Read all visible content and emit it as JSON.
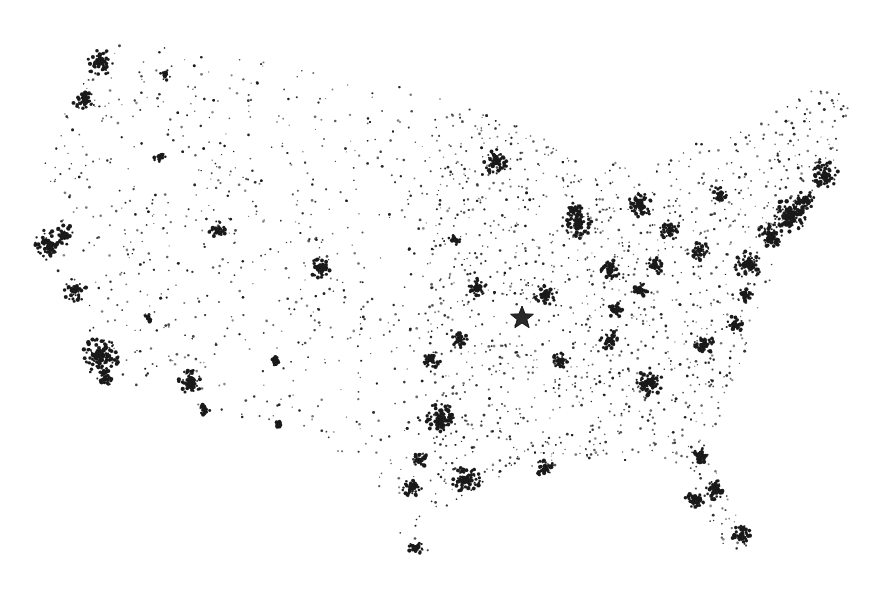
{
  "map": {
    "type": "dot-density population map",
    "region": "contiguous United States",
    "dot_color": "#1a1a1a",
    "background": "#ffffff",
    "outline": [
      [
        100,
        38
      ],
      [
        180,
        45
      ],
      [
        300,
        70
      ],
      [
        420,
        90
      ],
      [
        500,
        120
      ],
      [
        560,
        140
      ],
      [
        590,
        175
      ],
      [
        610,
        160
      ],
      [
        640,
        170
      ],
      [
        700,
        140
      ],
      [
        760,
        120
      ],
      [
        830,
        80
      ],
      [
        850,
        110
      ],
      [
        830,
        175
      ],
      [
        780,
        230
      ],
      [
        770,
        280
      ],
      [
        760,
        320
      ],
      [
        745,
        360
      ],
      [
        720,
        420
      ],
      [
        705,
        440
      ],
      [
        730,
        500
      ],
      [
        748,
        545
      ],
      [
        735,
        560
      ],
      [
        705,
        520
      ],
      [
        690,
        470
      ],
      [
        660,
        460
      ],
      [
        600,
        462
      ],
      [
        540,
        470
      ],
      [
        470,
        490
      ],
      [
        430,
        520
      ],
      [
        430,
        555
      ],
      [
        400,
        545
      ],
      [
        395,
        500
      ],
      [
        360,
        470
      ],
      [
        320,
        440
      ],
      [
        290,
        420
      ],
      [
        250,
        420
      ],
      [
        215,
        410
      ],
      [
        175,
        400
      ],
      [
        125,
        385
      ],
      [
        100,
        360
      ],
      [
        80,
        320
      ],
      [
        55,
        280
      ],
      [
        40,
        220
      ],
      [
        45,
        150
      ],
      [
        70,
        90
      ]
    ],
    "center_marker": {
      "icon": "star-icon",
      "x": 522,
      "y": 318,
      "r": 12
    },
    "clusters": [
      {
        "name": "Seattle",
        "x": 100,
        "y": 62,
        "r": 14,
        "n": 90
      },
      {
        "name": "Portland",
        "x": 85,
        "y": 100,
        "r": 12,
        "n": 70
      },
      {
        "name": "Spokane",
        "x": 165,
        "y": 75,
        "r": 6,
        "n": 25
      },
      {
        "name": "Boise",
        "x": 160,
        "y": 158,
        "r": 6,
        "n": 20
      },
      {
        "name": "San Francisco Bay",
        "x": 50,
        "y": 245,
        "r": 16,
        "n": 110
      },
      {
        "name": "Sacramento",
        "x": 65,
        "y": 235,
        "r": 10,
        "n": 50
      },
      {
        "name": "Central Valley",
        "x": 75,
        "y": 290,
        "r": 12,
        "n": 55
      },
      {
        "name": "Los Angeles",
        "x": 100,
        "y": 355,
        "r": 20,
        "n": 180
      },
      {
        "name": "San Diego",
        "x": 105,
        "y": 378,
        "r": 8,
        "n": 40
      },
      {
        "name": "Las Vegas",
        "x": 148,
        "y": 318,
        "r": 5,
        "n": 25
      },
      {
        "name": "Phoenix",
        "x": 190,
        "y": 382,
        "r": 12,
        "n": 80
      },
      {
        "name": "Tucson",
        "x": 205,
        "y": 410,
        "r": 6,
        "n": 30
      },
      {
        "name": "Salt Lake City",
        "x": 218,
        "y": 230,
        "r": 9,
        "n": 50
      },
      {
        "name": "Denver",
        "x": 320,
        "y": 268,
        "r": 10,
        "n": 60
      },
      {
        "name": "Albuquerque",
        "x": 275,
        "y": 360,
        "r": 6,
        "n": 25
      },
      {
        "name": "El Paso",
        "x": 278,
        "y": 425,
        "r": 5,
        "n": 20
      },
      {
        "name": "Minneapolis",
        "x": 495,
        "y": 162,
        "r": 13,
        "n": 80
      },
      {
        "name": "Milwaukee",
        "x": 575,
        "y": 210,
        "r": 8,
        "n": 45
      },
      {
        "name": "Chicago",
        "x": 578,
        "y": 225,
        "r": 14,
        "n": 110
      },
      {
        "name": "Detroit",
        "x": 640,
        "y": 205,
        "r": 12,
        "n": 90
      },
      {
        "name": "Cleveland",
        "x": 670,
        "y": 230,
        "r": 10,
        "n": 60
      },
      {
        "name": "Pittsburgh",
        "x": 700,
        "y": 250,
        "r": 10,
        "n": 60
      },
      {
        "name": "Indianapolis",
        "x": 610,
        "y": 270,
        "r": 10,
        "n": 55
      },
      {
        "name": "Columbus",
        "x": 655,
        "y": 265,
        "r": 9,
        "n": 50
      },
      {
        "name": "Cincinnati",
        "x": 640,
        "y": 290,
        "r": 8,
        "n": 45
      },
      {
        "name": "St Louis",
        "x": 545,
        "y": 295,
        "r": 11,
        "n": 65
      },
      {
        "name": "Kansas City",
        "x": 478,
        "y": 288,
        "r": 10,
        "n": 55
      },
      {
        "name": "Omaha",
        "x": 455,
        "y": 240,
        "r": 7,
        "n": 30
      },
      {
        "name": "Louisville",
        "x": 615,
        "y": 310,
        "r": 8,
        "n": 40
      },
      {
        "name": "Nashville",
        "x": 610,
        "y": 340,
        "r": 10,
        "n": 55
      },
      {
        "name": "Memphis",
        "x": 560,
        "y": 360,
        "r": 8,
        "n": 40
      },
      {
        "name": "Atlanta",
        "x": 650,
        "y": 382,
        "r": 14,
        "n": 100
      },
      {
        "name": "Charlotte",
        "x": 705,
        "y": 345,
        "r": 10,
        "n": 60
      },
      {
        "name": "Raleigh",
        "x": 735,
        "y": 325,
        "r": 9,
        "n": 50
      },
      {
        "name": "Richmond",
        "x": 745,
        "y": 295,
        "r": 8,
        "n": 45
      },
      {
        "name": "Washington DC",
        "x": 748,
        "y": 265,
        "r": 14,
        "n": 110
      },
      {
        "name": "Philadelphia",
        "x": 770,
        "y": 235,
        "r": 13,
        "n": 110
      },
      {
        "name": "New York",
        "x": 790,
        "y": 215,
        "r": 18,
        "n": 190
      },
      {
        "name": "Boston",
        "x": 825,
        "y": 175,
        "r": 14,
        "n": 110
      },
      {
        "name": "Hartford",
        "x": 805,
        "y": 200,
        "r": 10,
        "n": 60
      },
      {
        "name": "Buffalo",
        "x": 720,
        "y": 195,
        "r": 8,
        "n": 40
      },
      {
        "name": "Oklahoma City",
        "x": 432,
        "y": 360,
        "r": 9,
        "n": 45
      },
      {
        "name": "Tulsa",
        "x": 460,
        "y": 340,
        "r": 8,
        "n": 35
      },
      {
        "name": "Dallas",
        "x": 440,
        "y": 418,
        "r": 15,
        "n": 120
      },
      {
        "name": "Austin",
        "x": 420,
        "y": 460,
        "r": 8,
        "n": 45
      },
      {
        "name": "San Antonio",
        "x": 412,
        "y": 487,
        "r": 10,
        "n": 55
      },
      {
        "name": "Houston",
        "x": 466,
        "y": 480,
        "r": 14,
        "n": 110
      },
      {
        "name": "New Orleans",
        "x": 545,
        "y": 468,
        "r": 9,
        "n": 45
      },
      {
        "name": "Jacksonville",
        "x": 700,
        "y": 455,
        "r": 9,
        "n": 45
      },
      {
        "name": "Orlando",
        "x": 715,
        "y": 490,
        "r": 10,
        "n": 60
      },
      {
        "name": "Tampa",
        "x": 695,
        "y": 500,
        "r": 10,
        "n": 55
      },
      {
        "name": "Miami",
        "x": 742,
        "y": 535,
        "r": 10,
        "n": 70
      },
      {
        "name": "Corpus Christi",
        "x": 415,
        "y": 548,
        "r": 8,
        "n": 35
      }
    ],
    "background_dots": 2600
  }
}
